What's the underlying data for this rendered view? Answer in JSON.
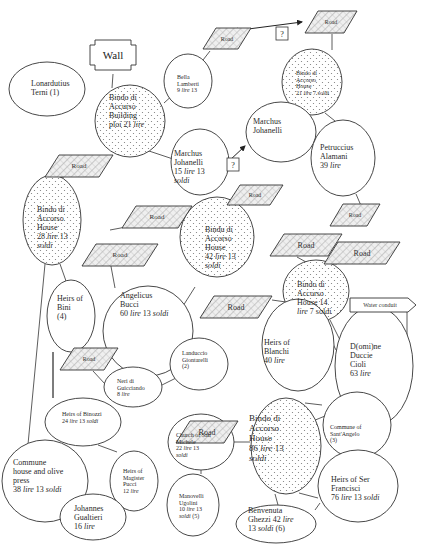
{
  "diagram": {
    "colors": {
      "stroke": "#333333",
      "fill": "#ffffff",
      "dot": "#7a7a7a",
      "hatch": "#9a9a9a",
      "road_fill": "#e6e6e6",
      "text": "#2a2a2a"
    },
    "wall": {
      "label": "Wall",
      "x": 90,
      "y": 40,
      "w": 46,
      "h": 30
    },
    "water_conduit": {
      "label": "Water conduit",
      "x": 350,
      "y": 298,
      "w": 66,
      "h": 14
    },
    "question_marks": [
      {
        "label": "?",
        "x": 276,
        "y": 27,
        "w": 12,
        "h": 13
      },
      {
        "label": "?",
        "x": 227,
        "y": 158,
        "w": 12,
        "h": 13
      }
    ],
    "roads": [
      {
        "id": "road-1",
        "label": "Road",
        "x": 203,
        "y": 28,
        "w": 48,
        "h": 21,
        "skew": 13,
        "size": 6
      },
      {
        "id": "road-2",
        "label": "Road",
        "x": 305,
        "y": 11,
        "w": 52,
        "h": 22,
        "skew": 13,
        "size": 6
      },
      {
        "id": "road-3",
        "label": "Road",
        "x": 45,
        "y": 155,
        "w": 68,
        "h": 22,
        "skew": 14,
        "size": 7
      },
      {
        "id": "road-4",
        "label": "Road",
        "x": 227,
        "y": 185,
        "w": 56,
        "h": 20,
        "skew": 13,
        "size": 6
      },
      {
        "id": "road-5",
        "label": "Road",
        "x": 330,
        "y": 204,
        "w": 50,
        "h": 22,
        "skew": 13,
        "size": 6
      },
      {
        "id": "road-6",
        "label": "Road",
        "x": 122,
        "y": 206,
        "w": 70,
        "h": 22,
        "skew": 14,
        "size": 7
      },
      {
        "id": "road-7",
        "label": "Road",
        "x": 82,
        "y": 244,
        "w": 76,
        "h": 22,
        "skew": 14,
        "size": 7
      },
      {
        "id": "road-8",
        "label": "Road",
        "x": 270,
        "y": 234,
        "w": 72,
        "h": 22,
        "skew": 14,
        "size": 8
      },
      {
        "id": "road-9",
        "label": "Road",
        "x": 324,
        "y": 242,
        "w": 76,
        "h": 22,
        "skew": 14,
        "size": 8
      },
      {
        "id": "road-10",
        "label": "Road",
        "x": 200,
        "y": 296,
        "w": 72,
        "h": 22,
        "skew": 14,
        "size": 8
      },
      {
        "id": "road-11",
        "label": "Road",
        "x": 60,
        "y": 348,
        "w": 58,
        "h": 22,
        "skew": 14,
        "size": 6
      },
      {
        "id": "road-12",
        "label": "Road",
        "x": 176,
        "y": 421,
        "w": 62,
        "h": 22,
        "skew": 14,
        "size": 8
      }
    ],
    "nodes": [
      {
        "id": "lonarduttus",
        "cx": 47,
        "cy": 89,
        "rx": 38,
        "ry": 27,
        "dotted": false,
        "tx": 31,
        "ty": 80,
        "size": 8,
        "lines": [
          [
            "Lonardutius",
            ""
          ],
          [
            "Terni (1)",
            ""
          ]
        ]
      },
      {
        "id": "bindo-building",
        "cx": 130,
        "cy": 121,
        "rx": 35,
        "ry": 36,
        "dotted": true,
        "tx": 109,
        "ty": 94,
        "size": 8,
        "lines": [
          [
            "Bindo di",
            ""
          ],
          [
            "Accurso",
            ""
          ],
          [
            "Building",
            ""
          ],
          [
            "ploi 21 ",
            "lire"
          ]
        ]
      },
      {
        "id": "bella-lamberti",
        "cx": 188,
        "cy": 81,
        "rx": 24,
        "ry": 27,
        "dotted": false,
        "tx": 177,
        "ty": 74,
        "size": 6,
        "lines": [
          [
            "Bella",
            ""
          ],
          [
            "Lamberti",
            ""
          ],
          [
            "9 ",
            "lire",
            " 13"
          ]
        ]
      },
      {
        "id": "bindo-house-21",
        "cx": 312,
        "cy": 82,
        "rx": 30,
        "ry": 33,
        "dotted": true,
        "tx": 296,
        "ty": 70,
        "size": 6,
        "lines": [
          [
            "Bindo di",
            ""
          ],
          [
            "Accorso",
            ""
          ],
          [
            "House",
            ""
          ],
          [
            "21 ",
            "lire",
            " 7 soldi"
          ]
        ]
      },
      {
        "id": "marchus-johanelli-1",
        "cx": 281,
        "cy": 132,
        "rx": 35,
        "ry": 30,
        "dotted": false,
        "tx": 253,
        "ty": 118,
        "size": 8,
        "lines": [
          [
            "Marchus",
            ""
          ],
          [
            "Johanelli",
            ""
          ]
        ]
      },
      {
        "id": "marchus-johanelli-2",
        "cx": 200,
        "cy": 162,
        "rx": 29,
        "ry": 33,
        "dotted": false,
        "tx": 174,
        "ty": 150,
        "size": 8,
        "lines": [
          [
            "Marchus",
            ""
          ],
          [
            "Johanelli",
            ""
          ],
          [
            "15 ",
            "lire",
            " 13"
          ],
          [
            "soldi",
            ""
          ]
        ]
      },
      {
        "id": "petruccius",
        "cx": 343,
        "cy": 158,
        "rx": 32,
        "ry": 38,
        "dotted": false,
        "tx": 320,
        "ty": 144,
        "size": 8,
        "lines": [
          [
            "Petruccius",
            ""
          ],
          [
            "Alamani",
            ""
          ],
          [
            "39 ",
            "lire"
          ]
        ]
      },
      {
        "id": "bindo-house-28",
        "cx": 52,
        "cy": 220,
        "rx": 29,
        "ry": 45,
        "dotted": true,
        "tx": 37,
        "ty": 206,
        "size": 8,
        "lines": [
          [
            "Bindo di",
            ""
          ],
          [
            "Accorso",
            ""
          ],
          [
            "House",
            ""
          ],
          [
            "28 ",
            "lire",
            " 13"
          ],
          [
            "soldi",
            ""
          ]
        ]
      },
      {
        "id": "bindu-house-42",
        "cx": 217,
        "cy": 237,
        "rx": 37,
        "ry": 40,
        "dotted": true,
        "tx": 205,
        "ty": 226,
        "size": 8,
        "lines": [
          [
            "Bindu di",
            ""
          ],
          [
            "Accorso",
            ""
          ],
          [
            "House",
            ""
          ],
          [
            "42 ",
            "lire",
            " 13"
          ],
          [
            "soldi",
            ""
          ]
        ]
      },
      {
        "id": "heirs-bini",
        "cx": 71,
        "cy": 316,
        "rx": 24,
        "ry": 36,
        "dotted": false,
        "tx": 57,
        "ty": 295,
        "size": 8,
        "lines": [
          [
            "Heirs of",
            ""
          ],
          [
            "Bini",
            ""
          ],
          [
            "(4)",
            ""
          ]
        ]
      },
      {
        "id": "angelicus-bucci",
        "cx": 148,
        "cy": 331,
        "rx": 45,
        "ry": 45,
        "dotted": false,
        "tx": 120,
        "ty": 292,
        "size": 8,
        "lines": [
          [
            "Angelicus",
            ""
          ],
          [
            "Bucci",
            ""
          ],
          [
            "60 ",
            "lire",
            " 13 ",
            "soldi"
          ]
        ]
      },
      {
        "id": "bindo-house-14",
        "cx": 316,
        "cy": 291,
        "rx": 33,
        "ry": 31,
        "dotted": true,
        "tx": 297,
        "ty": 281,
        "size": 8,
        "lines": [
          [
            "Bindo di",
            ""
          ],
          [
            "Accorso",
            ""
          ],
          [
            "House 14",
            ""
          ],
          [
            "lire",
            " 7 soldi"
          ]
        ]
      },
      {
        "id": "heirs-blanchi",
        "cx": 298,
        "cy": 345,
        "rx": 36,
        "ry": 46,
        "dotted": false,
        "tx": 264,
        "ty": 339,
        "size": 8,
        "lines": [
          [
            "Heirs of",
            ""
          ],
          [
            "Blanchi",
            ""
          ],
          [
            "40 ",
            "lire"
          ]
        ]
      },
      {
        "id": "domine-duccie",
        "cx": 374,
        "cy": 366,
        "rx": 39,
        "ry": 60,
        "dotted": false,
        "tx": 350,
        "ty": 343,
        "size": 8,
        "lines": [
          [
            "D(omi)ne",
            ""
          ],
          [
            "Duccie",
            ""
          ],
          [
            "Cioli",
            ""
          ],
          [
            "63 ",
            "lire"
          ]
        ]
      },
      {
        "id": "landuccio",
        "cx": 199,
        "cy": 364,
        "rx": 29,
        "ry": 26,
        "dotted": false,
        "tx": 182,
        "ty": 350,
        "size": 6,
        "lines": [
          [
            "Landuccio",
            ""
          ],
          [
            "Giontarelli",
            ""
          ],
          [
            "(2)",
            ""
          ]
        ]
      },
      {
        "id": "neri",
        "cx": 133,
        "cy": 387,
        "rx": 29,
        "ry": 20,
        "dotted": false,
        "tx": 117,
        "ty": 378,
        "size": 6,
        "lines": [
          [
            "Neri di",
            ""
          ],
          [
            "Guicciando",
            ""
          ],
          [
            "8 ",
            "lire"
          ]
        ]
      },
      {
        "id": "heirs-binozzi",
        "cx": 83,
        "cy": 422,
        "rx": 38,
        "ry": 24,
        "dotted": false,
        "tx": 62,
        "ty": 411,
        "size": 6,
        "lines": [
          [
            "Heirs of Binozzi",
            ""
          ],
          [
            "24 ",
            "lire",
            " 13 ",
            "soldi"
          ]
        ]
      },
      {
        "id": "commune-sant-angelo",
        "cx": 357,
        "cy": 425,
        "rx": 34,
        "ry": 33,
        "dotted": false,
        "tx": 330,
        "ty": 424,
        "size": 6,
        "lines": [
          [
            "Commune of",
            ""
          ],
          [
            "Sant'Angelo",
            ""
          ],
          [
            "(3)",
            ""
          ]
        ]
      },
      {
        "id": "bindo-house-86",
        "cx": 286,
        "cy": 446,
        "rx": 35,
        "ry": 48,
        "dotted": true,
        "tx": 249,
        "ty": 413,
        "size": 9,
        "lines": [
          [
            "Bindo di",
            ""
          ],
          [
            "Accorso",
            ""
          ],
          [
            "House",
            ""
          ],
          [
            "86 ",
            "lire",
            " 13"
          ],
          [
            "soldi",
            ""
          ]
        ]
      },
      {
        "id": "church-san-michele",
        "cx": 201,
        "cy": 442,
        "rx": 33,
        "ry": 28,
        "dotted": false,
        "tx": 176,
        "ty": 432,
        "size": 6,
        "lines": [
          [
            "Church of San",
            ""
          ],
          [
            "Michele",
            ""
          ],
          [
            "22 ",
            "lire",
            " 13"
          ],
          [
            "soldi",
            ""
          ]
        ]
      },
      {
        "id": "commune-house-olive",
        "cx": 45,
        "cy": 481,
        "rx": 43,
        "ry": 41,
        "dotted": false,
        "tx": 13,
        "ty": 459,
        "size": 8,
        "lines": [
          [
            "Commune",
            ""
          ],
          [
            "house and olive",
            ""
          ],
          [
            "press",
            ""
          ],
          [
            "38 ",
            "lire",
            " 13 ",
            "soldi"
          ]
        ]
      },
      {
        "id": "heirs-magister-pucci",
        "cx": 134,
        "cy": 481,
        "rx": 24,
        "ry": 30,
        "dotted": false,
        "tx": 123,
        "ty": 468,
        "size": 6,
        "lines": [
          [
            "Heirs of",
            ""
          ],
          [
            "Magister",
            ""
          ],
          [
            "Pucci",
            ""
          ],
          [
            "12 ",
            "lire"
          ]
        ]
      },
      {
        "id": "manovelli",
        "cx": 193,
        "cy": 505,
        "rx": 26,
        "ry": 31,
        "dotted": false,
        "tx": 179,
        "ty": 493,
        "size": 6,
        "lines": [
          [
            "Manovelli",
            ""
          ],
          [
            "Ugolini",
            ""
          ],
          [
            "10 ",
            "lire",
            " 13"
          ],
          [
            "soldi",
            " (5)"
          ]
        ]
      },
      {
        "id": "heirs-ser-francisci",
        "cx": 358,
        "cy": 486,
        "rx": 40,
        "ry": 36,
        "dotted": false,
        "tx": 331,
        "ty": 476,
        "size": 8,
        "lines": [
          [
            "Heirs of Ser",
            ""
          ],
          [
            "Francisci",
            ""
          ],
          [
            "76 ",
            "lire",
            " 13 ",
            "soldi"
          ]
        ]
      },
      {
        "id": "johannes-gualtieri",
        "cx": 93,
        "cy": 517,
        "rx": 33,
        "ry": 23,
        "dotted": false,
        "tx": 74,
        "ty": 505,
        "size": 8,
        "lines": [
          [
            "Johannes",
            ""
          ],
          [
            "Gualtieri",
            ""
          ],
          [
            "16 ",
            "lire"
          ]
        ]
      },
      {
        "id": "benvenuta-ghezzi",
        "cx": 276,
        "cy": 524,
        "rx": 40,
        "ry": 19,
        "dotted": false,
        "tx": 248,
        "ty": 507,
        "size": 8,
        "lines": [
          [
            "Benvenuta",
            ""
          ],
          [
            "Ghezzi 42 ",
            "lire"
          ],
          [
            "13 ",
            "soldi",
            " (6)"
          ]
        ]
      }
    ],
    "edges": [
      [
        113,
        74,
        112,
        88
      ],
      [
        164,
        103,
        175,
        93
      ],
      [
        210,
        51,
        203,
        60
      ],
      [
        332,
        34,
        332,
        50
      ],
      [
        146,
        150,
        173,
        159
      ],
      [
        296,
        105,
        287,
        113
      ],
      [
        325,
        113,
        335,
        121
      ],
      [
        356,
        194,
        362,
        208
      ],
      [
        64,
        177,
        58,
        177
      ],
      [
        236,
        204,
        234,
        198
      ],
      [
        126,
        227,
        110,
        230
      ],
      [
        110,
        261,
        115,
        288
      ],
      [
        60,
        264,
        66,
        281
      ],
      [
        45,
        264,
        27,
        455
      ],
      [
        183,
        306,
        195,
        287
      ],
      [
        297,
        257,
        306,
        262
      ],
      [
        337,
        264,
        312,
        262
      ],
      [
        272,
        300,
        286,
        302
      ],
      [
        330,
        320,
        341,
        342
      ],
      [
        330,
        338,
        336,
        350
      ],
      [
        407,
        312,
        407,
        360
      ],
      [
        143,
        376,
        150,
        366
      ],
      [
        162,
        385,
        176,
        378
      ],
      [
        105,
        384,
        93,
        371
      ],
      [
        53,
        352,
        53,
        398
      ],
      [
        98,
        445,
        117,
        452
      ],
      [
        234,
        442,
        250,
        442
      ],
      [
        201,
        470,
        201,
        474
      ],
      [
        308,
        423,
        325,
        416
      ],
      [
        305,
        403,
        322,
        405
      ],
      [
        299,
        493,
        318,
        498
      ],
      [
        275,
        494,
        278,
        505
      ],
      [
        315,
        510,
        320,
        503
      ],
      [
        75,
        516,
        63,
        510
      ],
      [
        124,
        508,
        117,
        511
      ],
      [
        205,
        441,
        209,
        441
      ]
    ],
    "arrows": [
      [
        233,
        31,
        302,
        22
      ],
      [
        213,
        176,
        245,
        146
      ]
    ]
  }
}
